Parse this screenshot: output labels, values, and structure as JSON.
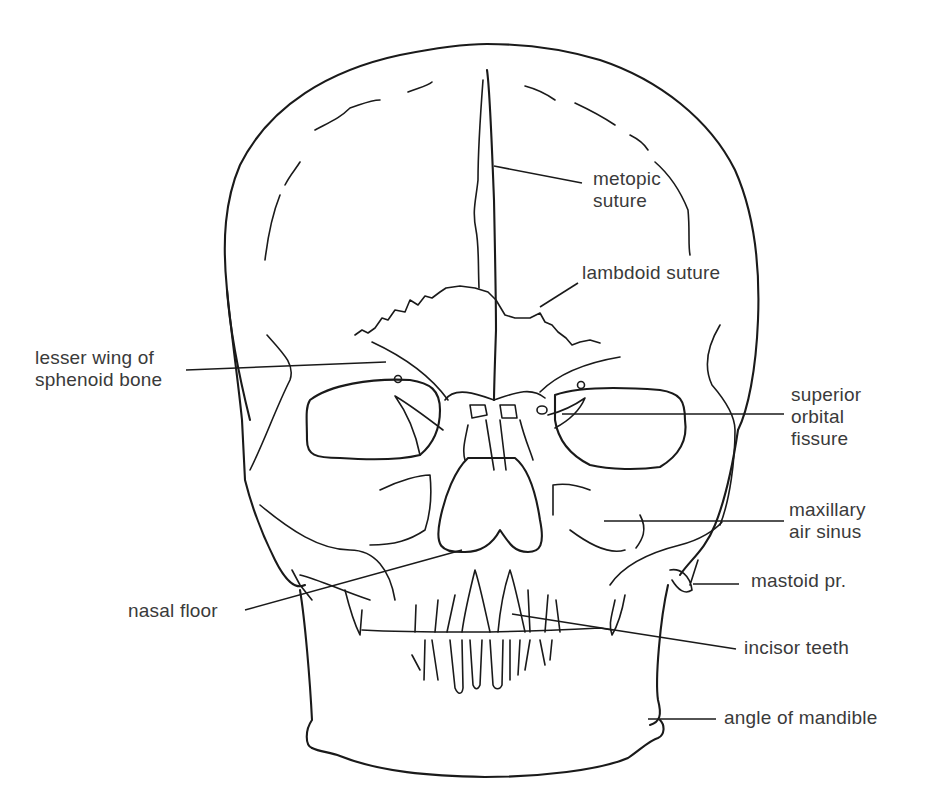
{
  "figure": {
    "line_color": "#1a1a1a",
    "text_color": "#3a3a3a",
    "background": "#ffffff"
  },
  "labels": [
    {
      "id": "metopic-suture",
      "text": "metopic\nsuture",
      "x": 593,
      "y": 168,
      "leader": [
        [
          494,
          166
        ],
        [
          582,
          183
        ]
      ]
    },
    {
      "id": "lambdoid-suture",
      "text": "lambdoid suture",
      "x": 582,
      "y": 262,
      "leader": [
        [
          540,
          307
        ],
        [
          578,
          283
        ]
      ]
    },
    {
      "id": "lesser-wing-of-sphenoid-bone",
      "text": "lesser wing of\nsphenoid bone",
      "x": 35,
      "y": 347,
      "leader": [
        [
          186,
          370
        ],
        [
          386,
          362
        ]
      ]
    },
    {
      "id": "superior-orbital-fissure",
      "text": "superior\norbital\nfissure",
      "x": 791,
      "y": 384,
      "leader": [
        [
          562,
          414
        ],
        [
          784,
          414
        ]
      ]
    },
    {
      "id": "maxillary-air-sinus",
      "text": "maxillary\nair sinus",
      "x": 789,
      "y": 499,
      "leader": [
        [
          604,
          521
        ],
        [
          784,
          521
        ]
      ]
    },
    {
      "id": "mastoid-pr",
      "text": "mastoid pr.",
      "x": 751,
      "y": 570,
      "leader": [
        [
          693,
          584
        ],
        [
          739,
          584
        ]
      ]
    },
    {
      "id": "nasal-floor",
      "text": "nasal floor",
      "x": 128,
      "y": 600,
      "leader": [
        [
          245,
          610
        ],
        [
          462,
          550
        ]
      ]
    },
    {
      "id": "incisor-teeth",
      "text": "incisor teeth",
      "x": 744,
      "y": 637,
      "leader": [
        [
          512,
          614
        ],
        [
          736,
          649
        ]
      ]
    },
    {
      "id": "angle-of-mandible",
      "text": "angle of mandible",
      "x": 724,
      "y": 707,
      "leader": [
        [
          648,
          719
        ],
        [
          716,
          719
        ]
      ]
    }
  ]
}
